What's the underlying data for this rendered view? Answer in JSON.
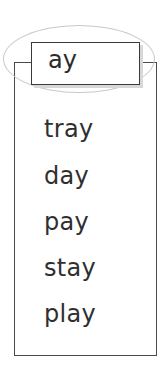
{
  "header": {
    "label": "ay"
  },
  "words": [
    "tray",
    "day",
    "pay",
    "stay",
    "play"
  ],
  "colors": {
    "ink": "#2f2f2f",
    "ellipse": "#c9c9c9",
    "border": "#4a4a4a"
  }
}
